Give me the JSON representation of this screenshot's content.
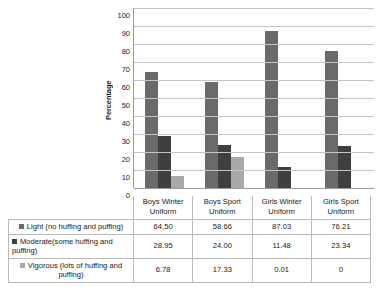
{
  "chart_data": {
    "type": "bar",
    "title": "",
    "xlabel": "",
    "ylabel": "Percentage",
    "ylim": [
      0,
      100
    ],
    "ytick_step": 10,
    "yticks": [
      100,
      90,
      80,
      70,
      60,
      50,
      40,
      30,
      20,
      10,
      0
    ],
    "grid": "horizontal",
    "legend_position": "table-below",
    "categories": [
      "Boys Winter Uniform",
      "Boys Sport Uniform",
      "Girls Winter Uniform",
      "Girls Sport Uniform"
    ],
    "category_lines": [
      [
        "Boys Winter",
        "Uniform"
      ],
      [
        "Boys Sport",
        "Uniform"
      ],
      [
        "Girls Winter",
        "Uniform"
      ],
      [
        "Girls Sport",
        "Uniform"
      ]
    ],
    "series": [
      {
        "name": "Light (no huffing and puffing)",
        "color": "#6a6a6a",
        "values": [
          64.5,
          58.66,
          87.03,
          76.21
        ],
        "display_values": [
          "64.50",
          "58.66",
          "87.03",
          "76.21"
        ]
      },
      {
        "name": "Moderate(some huffing and puffing)",
        "color": "#3f3f3f",
        "values": [
          28.95,
          24.0,
          11.48,
          23.34
        ],
        "display_values": [
          "28.95",
          "24.00",
          "11.48",
          "23.34"
        ]
      },
      {
        "name": "Vigorous (lots of huffing and puffing)",
        "color": "#a9a9a9",
        "values": [
          6.78,
          17.33,
          0.01,
          0
        ],
        "display_values": [
          "6.78",
          "17.33",
          "0.01",
          "0"
        ]
      }
    ]
  },
  "colors": {
    "series_light": "#6a6a6a",
    "series_moderate": "#3f3f3f",
    "series_vigorous": "#a9a9a9",
    "gridline": "#c4c4c4",
    "axis": "#9a9a9a",
    "table_border": "#b9b9b9",
    "text": "#1a1a1a",
    "background": "#ffffff"
  }
}
